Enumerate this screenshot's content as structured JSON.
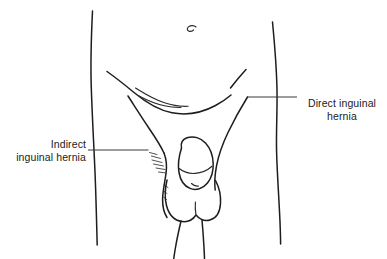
{
  "figure": {
    "kind": "line-drawing",
    "background_color": "#ffffff",
    "ink_color": "#1d1d1d",
    "text_color": "#1a1a1a"
  },
  "labels": {
    "direct": {
      "line1": "Direct inguinal",
      "line2": "hernia",
      "full_text": "Direct inguinal hernia",
      "align": "center",
      "side": "right"
    },
    "indirect": {
      "line1": "Indirect",
      "line2": "inguinal hernia",
      "full_text": "Indirect inguinal hernia",
      "align": "right",
      "side": "left"
    }
  },
  "leaders": {
    "direct_leader": "horizontal pointer from right label to right inguinal region",
    "indirect_leader": "horizontal pointer from left label to left inguinal region"
  },
  "anatomy_parts": {
    "left_flank": "left body contour",
    "right_flank": "right body contour",
    "navel": "umbilicus",
    "inguinal_crease_main": "main inguinal fold",
    "inguinal_crease_second": "secondary inguinal fold",
    "inguinal_crease_third": "tertiary inguinal fold",
    "right_inguinal_crease": "right inguinal fold",
    "right_groin_fold": "right groin contour",
    "left_groin_fold": "left groin contour",
    "penis": "penis",
    "glans": "glans contour",
    "scrotum": "scrotum",
    "raphe": "median raphe",
    "left_thigh": "left thigh contour",
    "right_thigh": "right thigh contour",
    "shading": "pubic shading hatch marks"
  }
}
